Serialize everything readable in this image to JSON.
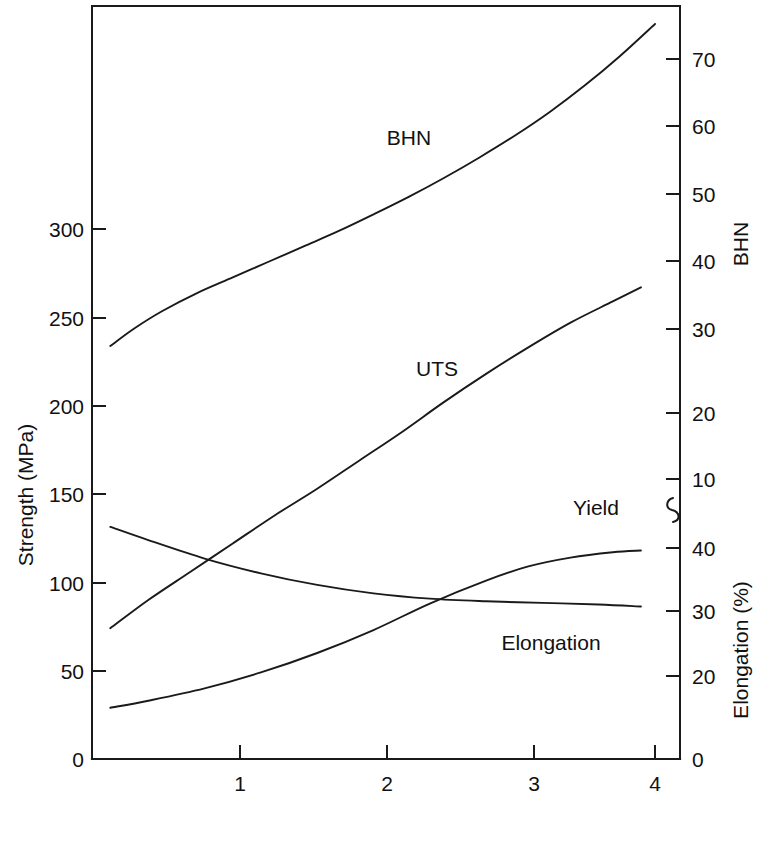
{
  "chart_data": {
    "type": "line",
    "title": "",
    "xlabel": "Mg (%)",
    "ylabel_left": "Strength (MPa)",
    "ylabel_right_upper": "BHN",
    "ylabel_right_lower": "Elongation (%)",
    "grid": false,
    "legend": "inline-curve-labels",
    "xlim": [
      0,
      4.2
    ],
    "x_ticks": [
      "1",
      "2",
      "3",
      "4"
    ],
    "x_tick_values": [
      1,
      2,
      3,
      4
    ],
    "left_axis": {
      "label": "Strength (MPa)",
      "ticks": [
        "0",
        "50",
        "100",
        "150",
        "200",
        "250",
        "300"
      ],
      "tick_values": [
        0,
        50,
        100,
        150,
        200,
        250,
        300
      ],
      "lim": [
        0,
        320
      ]
    },
    "right_axis_upper": {
      "label": "BHN",
      "ticks": [
        "10",
        "20",
        "30",
        "40",
        "50",
        "60",
        "70"
      ],
      "tick_values": [
        10,
        20,
        30,
        40,
        50,
        60,
        70
      ],
      "note": "upper segment of broken right-hand axis"
    },
    "right_axis_lower": {
      "label": "Elongation (%)",
      "ticks": [
        "0",
        "20",
        "30",
        "40"
      ],
      "tick_values": [
        0,
        20,
        30,
        40
      ],
      "note": "lower segment of broken right-hand axis, axis break symbol between segments"
    },
    "series": [
      {
        "name": "BHN",
        "label": "BHN",
        "axis": "right-upper",
        "unit": "BHN",
        "points": [
          [
            0.13,
            29.0
          ],
          [
            0.3,
            31.5
          ],
          [
            0.5,
            34.0
          ],
          [
            0.75,
            36.6
          ],
          [
            1.0,
            38.8
          ],
          [
            1.25,
            41.0
          ],
          [
            1.5,
            43.2
          ],
          [
            1.75,
            45.4
          ],
          [
            2.0,
            47.8
          ],
          [
            2.25,
            50.3
          ],
          [
            2.5,
            53.0
          ],
          [
            2.75,
            55.9
          ],
          [
            3.0,
            59.0
          ],
          [
            3.25,
            62.4
          ],
          [
            3.5,
            66.2
          ],
          [
            3.75,
            70.4
          ],
          [
            4.0,
            75.0
          ]
        ]
      },
      {
        "name": "UTS",
        "label": "UTS",
        "axis": "left",
        "unit": "MPa",
        "points": [
          [
            0.13,
            74
          ],
          [
            0.4,
            90
          ],
          [
            0.7,
            106
          ],
          [
            1.0,
            122
          ],
          [
            1.3,
            138
          ],
          [
            1.6,
            153
          ],
          [
            1.9,
            169
          ],
          [
            2.2,
            185
          ],
          [
            2.5,
            202
          ],
          [
            2.8,
            218
          ],
          [
            3.1,
            233
          ],
          [
            3.4,
            247
          ],
          [
            3.7,
            259
          ],
          [
            3.9,
            267
          ]
        ]
      },
      {
        "name": "Yield",
        "label": "Yield",
        "axis": "left",
        "unit": "MPa",
        "points": [
          [
            0.13,
            29
          ],
          [
            0.4,
            33
          ],
          [
            0.8,
            40
          ],
          [
            1.2,
            49
          ],
          [
            1.6,
            60
          ],
          [
            2.0,
            73
          ],
          [
            2.4,
            88
          ],
          [
            2.8,
            101
          ],
          [
            3.1,
            109
          ],
          [
            3.4,
            114
          ],
          [
            3.7,
            117
          ],
          [
            3.9,
            118
          ]
        ]
      },
      {
        "name": "Elongation",
        "label": "Elongation",
        "axis": "right-lower",
        "unit": "%",
        "points": [
          [
            0.13,
            44.0
          ],
          [
            0.4,
            41.5
          ],
          [
            0.8,
            38.0
          ],
          [
            1.2,
            35.2
          ],
          [
            1.6,
            33.0
          ],
          [
            2.0,
            31.4
          ],
          [
            2.4,
            30.4
          ],
          [
            2.8,
            29.9
          ],
          [
            3.2,
            29.6
          ],
          [
            3.6,
            29.3
          ],
          [
            3.9,
            28.9
          ]
        ]
      }
    ],
    "curve_labels": [
      {
        "text": "BHN",
        "x_px": 409,
        "y_px": 145
      },
      {
        "text": "UTS",
        "x_px": 437,
        "y_px": 376
      },
      {
        "text": "Yield",
        "x_px": 596,
        "y_px": 515
      },
      {
        "text": "Elongation",
        "x_px": 551,
        "y_px": 650
      }
    ]
  },
  "axis_titles": {
    "x": "Mg (%)",
    "left": "Strength (MPa)",
    "right_upper": "BHN",
    "right_lower": "Elongation (%)"
  },
  "colors": {
    "ink": "#1a1a1a",
    "background": "#ffffff"
  }
}
